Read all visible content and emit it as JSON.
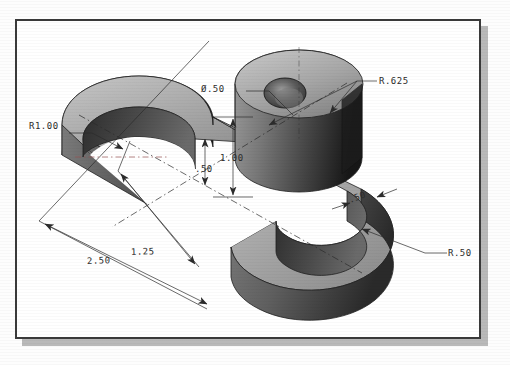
{
  "drawing": {
    "title": "Isometric shaded solid model of a C-shaped bracket with vertical boss",
    "view": "isometric",
    "frame": {
      "border_color": "#3a3a3a",
      "paper_color": "#ffffff",
      "shadow_color": "#b9b9b9"
    },
    "shading": {
      "top_face": "#a8a8a8",
      "top_face_light": "#c3c3c3",
      "side_face_mid": "#6e6e6e",
      "side_face_dark": "#1a1a1a",
      "bore_dark": "#3b3b3b",
      "outline": "#2b2b2b"
    },
    "dimensions": [
      {
        "id": "r1-00",
        "label": "R1.00",
        "kind": "radius",
        "x": 26,
        "y": 107
      },
      {
        "id": "dia-50",
        "label": "Ø.50",
        "kind": "diameter",
        "x": 198,
        "y": 72
      },
      {
        "id": "r-625",
        "label": "R.625",
        "kind": "radius",
        "x": 375,
        "y": 64
      },
      {
        "id": "h-1-00",
        "label": "1.00",
        "kind": "linear",
        "x": 218,
        "y": 140
      },
      {
        "id": "h-50",
        "label": ".50",
        "kind": "linear",
        "x": 196,
        "y": 151
      },
      {
        "id": "t-50",
        "label": ".50",
        "kind": "linear",
        "x": 347,
        "y": 198
      },
      {
        "id": "r-50",
        "label": "R.50",
        "kind": "radius",
        "x": 443,
        "y": 249
      },
      {
        "id": "w-2-50",
        "label": "2.50",
        "kind": "linear",
        "x": 83,
        "y": 259
      },
      {
        "id": "w-1-25",
        "label": "1.25",
        "kind": "linear",
        "x": 127,
        "y": 253
      }
    ]
  }
}
